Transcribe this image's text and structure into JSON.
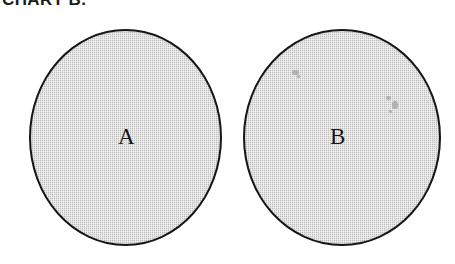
{
  "figure": {
    "caption": "CHART B.",
    "background_color": "#ffffff",
    "outline_color": "#151515",
    "fill_color": "#c9c9c9",
    "text_color": "#141414"
  },
  "shapes": [
    {
      "label": "A",
      "type": "circle",
      "fill": "#c9c9c9",
      "outline": "#151515"
    },
    {
      "label": "B",
      "type": "circle",
      "fill": "#c9c9c9",
      "outline": "#151515"
    }
  ]
}
